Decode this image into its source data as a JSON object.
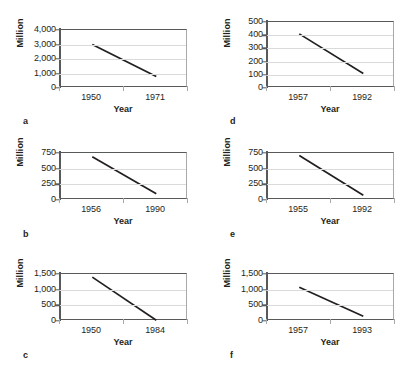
{
  "figure": {
    "ylabel": "Million",
    "xlabel": "Year",
    "panels": [
      {
        "letter": "a",
        "ylabel": "Million",
        "xlabel": "Year",
        "yticks": [
          "0",
          "1,000",
          "2,000",
          "3,000",
          "4,000"
        ],
        "xticks": [
          "1950",
          "1971"
        ]
      },
      {
        "letter": "b",
        "ylabel": "Million",
        "xlabel": "Year",
        "yticks": [
          "0",
          "250",
          "500",
          "750"
        ],
        "xticks": [
          "1956",
          "1990"
        ]
      },
      {
        "letter": "c",
        "ylabel": "Million",
        "xlabel": "Year",
        "yticks": [
          "0",
          "500",
          "1,000",
          "1,500"
        ],
        "xticks": [
          "1950",
          "1984"
        ]
      },
      {
        "letter": "d",
        "ylabel": "Million",
        "xlabel": "Year",
        "yticks": [
          "0",
          "100",
          "200",
          "300",
          "400",
          "500"
        ],
        "xticks": [
          "1957",
          "1992"
        ]
      },
      {
        "letter": "e",
        "ylabel": "Million",
        "xlabel": "Year",
        "yticks": [
          "0",
          "250",
          "500",
          "750"
        ],
        "xticks": [
          "1955",
          "1992"
        ]
      },
      {
        "letter": "f",
        "ylabel": "Million",
        "xlabel": "Year",
        "yticks": [
          "0",
          "500",
          "1,000",
          "1,500"
        ],
        "xticks": [
          "1957",
          "1993"
        ]
      }
    ]
  },
  "chart_data": [
    {
      "type": "line",
      "panel": "a",
      "title": "",
      "xlabel": "Year",
      "ylabel": "Million",
      "x": [
        1950,
        1971
      ],
      "values": [
        3000,
        800
      ],
      "xtick_labels": [
        "1950",
        "1971"
      ],
      "ytick_labels": [
        "0",
        "1,000",
        "2,000",
        "3,000",
        "4,000"
      ],
      "ytick_values": [
        0,
        1000,
        2000,
        3000,
        4000
      ],
      "ylim": [
        0,
        4000
      ],
      "grid": true,
      "legend": "none"
    },
    {
      "type": "line",
      "panel": "b",
      "title": "",
      "xlabel": "Year",
      "ylabel": "Million",
      "x": [
        1956,
        1990
      ],
      "values": [
        690,
        100
      ],
      "xtick_labels": [
        "1956",
        "1990"
      ],
      "ytick_labels": [
        "0",
        "250",
        "500",
        "750"
      ],
      "ytick_values": [
        0,
        250,
        500,
        750
      ],
      "ylim": [
        0,
        750
      ],
      "grid": true,
      "legend": "none"
    },
    {
      "type": "line",
      "panel": "c",
      "title": "",
      "xlabel": "Year",
      "ylabel": "Million",
      "x": [
        1950,
        1984
      ],
      "values": [
        1400,
        25
      ],
      "xtick_labels": [
        "1950",
        "1984"
      ],
      "ytick_labels": [
        "0",
        "500",
        "1,000",
        "1,500"
      ],
      "ytick_values": [
        0,
        500,
        1000,
        1500
      ],
      "ylim": [
        0,
        1500
      ],
      "grid": true,
      "legend": "none"
    },
    {
      "type": "line",
      "panel": "d",
      "title": "",
      "xlabel": "Year",
      "ylabel": "Million",
      "x": [
        1957,
        1992
      ],
      "values": [
        410,
        110
      ],
      "xtick_labels": [
        "1957",
        "1992"
      ],
      "ytick_labels": [
        "0",
        "100",
        "200",
        "300",
        "400",
        "500"
      ],
      "ytick_values": [
        0,
        100,
        200,
        300,
        400,
        500
      ],
      "ylim": [
        0,
        500
      ],
      "grid": true,
      "legend": "none"
    },
    {
      "type": "line",
      "panel": "e",
      "title": "",
      "xlabel": "Year",
      "ylabel": "Million",
      "x": [
        1955,
        1992
      ],
      "values": [
        710,
        75
      ],
      "xtick_labels": [
        "1955",
        "1992"
      ],
      "ytick_labels": [
        "0",
        "250",
        "500",
        "750"
      ],
      "ytick_values": [
        0,
        250,
        500,
        750
      ],
      "ylim": [
        0,
        750
      ],
      "grid": true,
      "legend": "none"
    },
    {
      "type": "line",
      "panel": "f",
      "title": "",
      "xlabel": "Year",
      "ylabel": "Million",
      "x": [
        1957,
        1993
      ],
      "values": [
        1080,
        150
      ],
      "xtick_labels": [
        "1957",
        "1993"
      ],
      "ytick_labels": [
        "0",
        "500",
        "1,000",
        "1,500"
      ],
      "ytick_values": [
        0,
        500,
        1000,
        1500
      ],
      "ylim": [
        0,
        1500
      ],
      "grid": true,
      "legend": "none"
    }
  ]
}
